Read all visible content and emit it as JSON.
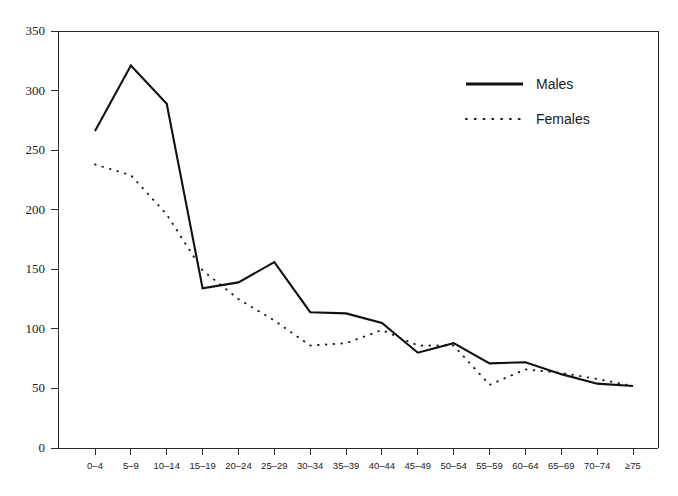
{
  "chart_data": {
    "type": "line",
    "title": "",
    "subtitle": "",
    "xlabel": "",
    "ylabel": "",
    "categories": [
      "0–4",
      "5–9",
      "10–14",
      "15–19",
      "20–24",
      "25–29",
      "30–34",
      "35–39",
      "40–44",
      "45–49",
      "50–54",
      "55–59",
      "60–64",
      "65–69",
      "70–74",
      "≥75"
    ],
    "series": [
      {
        "name": "Males",
        "style": "solid",
        "color": "#111111",
        "values": [
          266,
          321,
          289,
          134,
          139,
          156,
          114,
          113,
          105,
          80,
          88,
          71,
          72,
          62,
          54,
          52
        ]
      },
      {
        "name": "Females",
        "style": "dotted",
        "color": "#1a1a1a",
        "values": [
          238,
          229,
          196,
          149,
          125,
          107,
          86,
          88,
          99,
          86,
          86,
          53,
          66,
          63,
          58,
          52
        ]
      }
    ],
    "ylim": [
      0,
      350
    ],
    "yticks": [
      0,
      50,
      100,
      150,
      200,
      250,
      300,
      350
    ],
    "ytick_labels": [
      "0",
      "50",
      "100",
      "150",
      "200",
      "250",
      "300",
      "350"
    ],
    "grid": false,
    "legend_position": "top-right",
    "legend_entries": [
      {
        "label": "Males",
        "style": "solid"
      },
      {
        "label": "Females",
        "style": "dotted"
      }
    ]
  }
}
